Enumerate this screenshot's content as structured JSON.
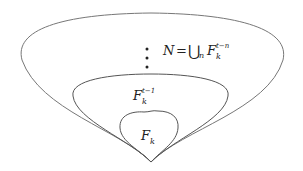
{
  "diagram": {
    "type": "nested-sets",
    "stroke_color": "#555555",
    "regions": [
      {
        "id": "outer",
        "label": "N = ⋃ₙ F_k^{t−n}"
      },
      {
        "id": "middle",
        "label": "F_k^{t−1}"
      },
      {
        "id": "inner",
        "label": "F_k"
      }
    ],
    "outer": {
      "label_lhs": "N",
      "label_eq": "=",
      "label_union": "⋃",
      "label_union_sub": "n",
      "label_F": "F",
      "label_sub": "k",
      "label_sup": "t−n"
    },
    "middle": {
      "label_F": "F",
      "label_sub": "k",
      "label_sup": "t−1"
    },
    "inner": {
      "label_F": "F",
      "label_sub": "k"
    },
    "ellipsis": "vertical dots"
  }
}
